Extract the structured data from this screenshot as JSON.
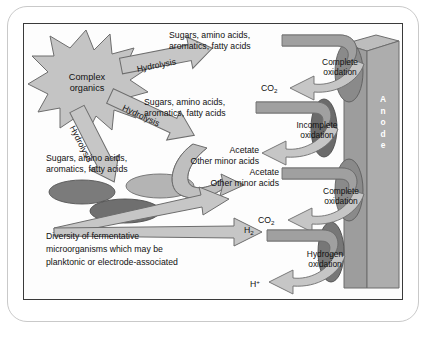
{
  "figure": {
    "colors": {
      "arrow_fill": "#c6c6c6",
      "arrow_stroke": "#6d6d6d",
      "band_fill": "#a0a0a0",
      "anode_fill": "#a9a9a9",
      "anode_top_fill": "#bdbdbd",
      "cell_dark": "#777777",
      "cell_darker": "#5f5f5f",
      "cell_light": "#b4b4b4",
      "burst_fill": "#c4c4c4",
      "frame_outer": "#c9c9c9",
      "frame_inner": "#3a3a3a",
      "text": "#111111",
      "anode_label_color": "#ffffff"
    },
    "source_node": {
      "label_line1": "Complex",
      "label_line2": "organics",
      "shape": "starburst"
    },
    "hydrolysis_arrows": [
      {
        "label": "Hydrolysis",
        "angle_deg": -12
      },
      {
        "label": "Hydrolysis",
        "angle_deg": 24
      },
      {
        "label": "Hydrolysis",
        "angle_deg": 62
      }
    ],
    "substrate_labels": [
      {
        "line1": "Sugars, amino acids,",
        "line2": "aromatics, fatty acids"
      },
      {
        "line1": "Sugars, amino acids,",
        "line2": "aromatics, fatty acids"
      },
      {
        "line1": "Sugars, amino acids,",
        "line2": "aromatics, fatty acids"
      }
    ],
    "product_labels": [
      {
        "line1": "Acetate",
        "line2": "Other minor acids"
      },
      {
        "line1": "Acetate",
        "line2": "Other minor acids"
      }
    ],
    "small_species": [
      {
        "formula": "CO",
        "sub": "2",
        "sup": ""
      },
      {
        "formula": "CO",
        "sub": "2",
        "sup": ""
      },
      {
        "formula": "H",
        "sub": "2",
        "sup": ""
      },
      {
        "formula": "H",
        "sub": "",
        "sup": "+"
      }
    ],
    "oxidation_labels": [
      {
        "line1": "Complete",
        "line2": "oxidation"
      },
      {
        "line1": "Incomplete",
        "line2": "oxidation"
      },
      {
        "line1": "Complete",
        "line2": "oxidation"
      },
      {
        "line1": "Hydrogen",
        "line2": "oxidation"
      }
    ],
    "anode": {
      "label": "Anode",
      "letters": [
        "A",
        "n",
        "o",
        "d",
        "e"
      ]
    },
    "caption": {
      "line1": "Diversity of fermentative",
      "line2": "microorganisms which may be",
      "line3": "planktonic or electrode-associated"
    },
    "cell_count_left": 3,
    "cell_count_anode": 4
  }
}
